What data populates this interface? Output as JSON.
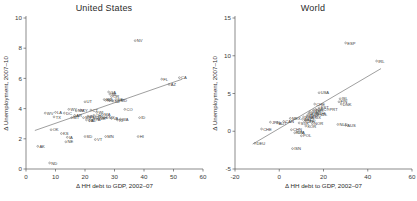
{
  "figure": {
    "panels": [
      {
        "id": "united-states",
        "title": "United States",
        "xlabel": "Δ HH debt to GDP, 2002–07",
        "ylabel": "Δ Unemployment, 2007–10",
        "xlim": [
          0,
          60
        ],
        "ylim": [
          0,
          10
        ],
        "xticks": [
          0,
          10,
          20,
          30,
          40,
          50,
          60
        ],
        "yticks": [
          0,
          2,
          4,
          6,
          8,
          10
        ],
        "fit": {
          "x0": 3.0,
          "y0": 2.55,
          "x1": 53.0,
          "y1": 5.95
        },
        "points": [
          {
            "label": "AK",
            "x": 4.0,
            "y": 1.5
          },
          {
            "label": "ND",
            "x": 8.0,
            "y": 0.4
          },
          {
            "label": "WV",
            "x": 6.5,
            "y": 3.7
          },
          {
            "label": "LA",
            "x": 10.0,
            "y": 3.75
          },
          {
            "label": "DC",
            "x": 13.0,
            "y": 3.7
          },
          {
            "label": "TX",
            "x": 9.5,
            "y": 3.45
          },
          {
            "label": "OK",
            "x": 8.5,
            "y": 2.6
          },
          {
            "label": "KS",
            "x": 12.0,
            "y": 2.35
          },
          {
            "label": "IA",
            "x": 14.0,
            "y": 2.1
          },
          {
            "label": "NE",
            "x": 13.5,
            "y": 1.8
          },
          {
            "label": "WY",
            "x": 14.5,
            "y": 3.95
          },
          {
            "label": "NM",
            "x": 17.0,
            "y": 3.85
          },
          {
            "label": "AR",
            "x": 16.5,
            "y": 3.55
          },
          {
            "label": "MT",
            "x": 15.5,
            "y": 3.4
          },
          {
            "label": "KY",
            "x": 18.5,
            "y": 3.9
          },
          {
            "label": "UT",
            "x": 20.0,
            "y": 4.45
          },
          {
            "label": "SD",
            "x": 20.0,
            "y": 2.15
          },
          {
            "label": "VT",
            "x": 23.5,
            "y": 1.95
          },
          {
            "label": "CT",
            "x": 22.0,
            "y": 3.9
          },
          {
            "label": "MS",
            "x": 19.5,
            "y": 3.4
          },
          {
            "label": "IN",
            "x": 21.0,
            "y": 3.5
          },
          {
            "label": "MO",
            "x": 22.0,
            "y": 3.45
          },
          {
            "label": "AL",
            "x": 21.5,
            "y": 3.2
          },
          {
            "label": "TN",
            "x": 20.5,
            "y": 3.25
          },
          {
            "label": "OH",
            "x": 23.0,
            "y": 3.55
          },
          {
            "label": "WI",
            "x": 24.0,
            "y": 3.75
          },
          {
            "label": "PA",
            "x": 23.0,
            "y": 3.3
          },
          {
            "label": "ME",
            "x": 24.5,
            "y": 3.35
          },
          {
            "label": "NH",
            "x": 25.0,
            "y": 3.45
          },
          {
            "label": "MA",
            "x": 26.0,
            "y": 3.6
          },
          {
            "label": "SC",
            "x": 26.5,
            "y": 4.6
          },
          {
            "label": "NC",
            "x": 27.0,
            "y": 4.55
          },
          {
            "label": "GA",
            "x": 28.0,
            "y": 5.1
          },
          {
            "label": "MI",
            "x": 28.5,
            "y": 4.95
          },
          {
            "label": "OR",
            "x": 29.0,
            "y": 4.8
          },
          {
            "label": "IL",
            "x": 28.0,
            "y": 4.6
          },
          {
            "label": "NJ",
            "x": 29.5,
            "y": 4.5
          },
          {
            "label": "DE",
            "x": 30.5,
            "y": 4.6
          },
          {
            "label": "MD",
            "x": 31.5,
            "y": 4.55
          },
          {
            "label": "NY",
            "x": 27.5,
            "y": 3.4
          },
          {
            "label": "VA",
            "x": 29.0,
            "y": 3.35
          },
          {
            "label": "MN",
            "x": 27.0,
            "y": 2.15
          },
          {
            "label": "WA",
            "x": 32.0,
            "y": 3.3
          },
          {
            "label": "RI",
            "x": 31.0,
            "y": 3.25
          },
          {
            "label": "CO",
            "x": 33.5,
            "y": 3.95
          },
          {
            "label": "HI",
            "x": 38.0,
            "y": 2.15
          },
          {
            "label": "ID",
            "x": 38.5,
            "y": 3.4
          },
          {
            "label": "FL",
            "x": 46.0,
            "y": 5.95
          },
          {
            "label": "AZ",
            "x": 48.5,
            "y": 5.6
          },
          {
            "label": "CA",
            "x": 52.0,
            "y": 6.05
          },
          {
            "label": "NV",
            "x": 37.0,
            "y": 8.5
          }
        ]
      },
      {
        "id": "world",
        "title": "World",
        "xlabel": "Δ HH debt to GDP, 2002–07",
        "ylabel": "Δ Unemployment, 2007–10",
        "xlim": [
          -20,
          60
        ],
        "ylim": [
          -5,
          15
        ],
        "xticks": [
          -20,
          0,
          20,
          40,
          60
        ],
        "yticks": [
          -5,
          0,
          5,
          10,
          15
        ],
        "fit": {
          "x0": -12.0,
          "y0": -1.7,
          "x1": 46.0,
          "y1": 8.3
        },
        "points": [
          {
            "label": "DEU",
            "x": -11.0,
            "y": -1.6
          },
          {
            "label": "CHE",
            "x": -8.0,
            "y": 0.3
          },
          {
            "label": "JPN",
            "x": -4.0,
            "y": 1.2
          },
          {
            "label": "AUT",
            "x": -1.0,
            "y": 1.1
          },
          {
            "label": "CAN",
            "x": 2.0,
            "y": 1.3
          },
          {
            "label": "MEX",
            "x": 5.0,
            "y": 1.7
          },
          {
            "label": "CHN",
            "x": 5.5,
            "y": 0.2
          },
          {
            "label": "IDN",
            "x": 7.0,
            "y": -0.2
          },
          {
            "label": "ITA",
            "x": 8.0,
            "y": -0.1
          },
          {
            "label": "POL",
            "x": 10.0,
            "y": -0.6
          },
          {
            "label": "ISN",
            "x": 6.0,
            "y": -2.3
          },
          {
            "label": "SVK",
            "x": 9.0,
            "y": 1.1
          },
          {
            "label": "BEL",
            "x": 10.5,
            "y": 1.6
          },
          {
            "label": "FRA",
            "x": 11.0,
            "y": 1.9
          },
          {
            "label": "NLD",
            "x": 12.0,
            "y": 1.5
          },
          {
            "label": "SWE",
            "x": 12.5,
            "y": 2.0
          },
          {
            "label": "CZE",
            "x": 11.5,
            "y": 1.3
          },
          {
            "label": "HUN",
            "x": 13.0,
            "y": 2.2
          },
          {
            "label": "SVN",
            "x": 13.5,
            "y": 2.4
          },
          {
            "label": "GBR",
            "x": 14.0,
            "y": 2.6
          },
          {
            "label": "LUX",
            "x": 14.5,
            "y": 1.8
          },
          {
            "label": "KOR",
            "x": 12.0,
            "y": 0.7
          },
          {
            "label": "NOR",
            "x": 15.0,
            "y": 1.0
          },
          {
            "label": "TUR",
            "x": 15.5,
            "y": 2.8
          },
          {
            "label": "GRC",
            "x": 16.5,
            "y": 2.9
          },
          {
            "label": "CHL",
            "x": 17.0,
            "y": 2.4
          },
          {
            "label": "NZL",
            "x": 17.5,
            "y": 2.2
          },
          {
            "label": "EST",
            "x": 18.0,
            "y": 3.1
          },
          {
            "label": "CHE2",
            "x": 16.0,
            "y": 3.6
          },
          {
            "label": "USA",
            "x": 18.0,
            "y": 5.1
          },
          {
            "label": "PRT",
            "x": 22.0,
            "y": 2.9
          },
          {
            "label": "FIN",
            "x": 27.0,
            "y": 3.9
          },
          {
            "label": "ISL",
            "x": 27.5,
            "y": 4.3
          },
          {
            "label": "DNK",
            "x": 28.0,
            "y": 3.6
          },
          {
            "label": "AUS",
            "x": 30.0,
            "y": 0.8
          },
          {
            "label": "NLD2",
            "x": 26.5,
            "y": 0.9
          },
          {
            "label": "ESP",
            "x": 30.0,
            "y": 11.7
          },
          {
            "label": "IRL",
            "x": 44.0,
            "y": 9.3
          }
        ]
      }
    ]
  }
}
